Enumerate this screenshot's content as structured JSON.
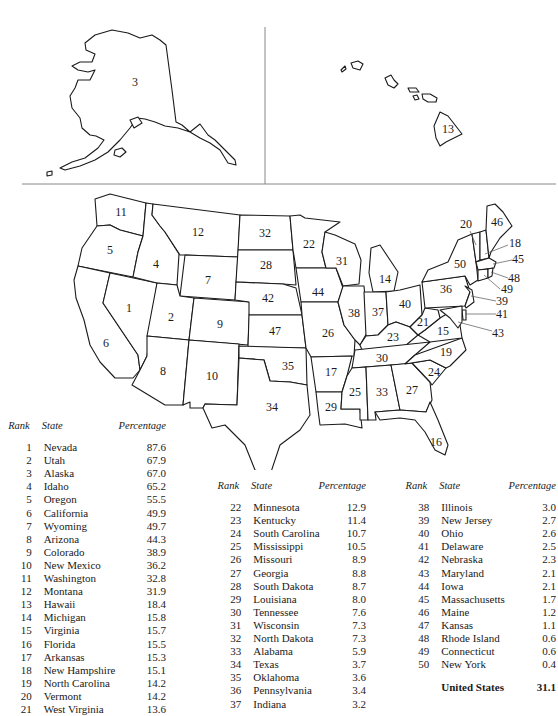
{
  "map": {
    "insets": [
      {
        "name": "Alaska",
        "rank": "3"
      },
      {
        "name": "Hawaii",
        "rank": "13"
      }
    ],
    "labels": [
      {
        "rank": "1",
        "state": "Nevada",
        "x": 129,
        "y": 309
      },
      {
        "rank": "2",
        "state": "Utah",
        "x": 171,
        "y": 318
      },
      {
        "rank": "3",
        "state": "Alaska",
        "x": 135,
        "y": 83
      },
      {
        "rank": "4",
        "state": "Idaho",
        "x": 156,
        "y": 265
      },
      {
        "rank": "5",
        "state": "Oregon",
        "x": 110,
        "y": 251
      },
      {
        "rank": "6",
        "state": "California",
        "x": 106,
        "y": 344
      },
      {
        "rank": "7",
        "state": "Wyoming",
        "x": 208,
        "y": 281
      },
      {
        "rank": "8",
        "state": "Arizona",
        "x": 163,
        "y": 372
      },
      {
        "rank": "9",
        "state": "Colorado",
        "x": 220,
        "y": 325
      },
      {
        "rank": "10",
        "state": "New Mexico",
        "x": 212,
        "y": 377
      },
      {
        "rank": "11",
        "state": "Washington",
        "x": 121,
        "y": 213
      },
      {
        "rank": "12",
        "state": "Montana",
        "x": 198,
        "y": 233
      },
      {
        "rank": "13",
        "state": "Hawaii",
        "x": 448,
        "y": 130
      },
      {
        "rank": "14",
        "state": "Michigan",
        "x": 385,
        "y": 280
      },
      {
        "rank": "15",
        "state": "Virginia",
        "x": 443,
        "y": 332
      },
      {
        "rank": "16",
        "state": "Florida",
        "x": 436,
        "y": 443
      },
      {
        "rank": "17",
        "state": "Arkansas",
        "x": 331,
        "y": 373
      },
      {
        "rank": "18",
        "state": "New Hampshire",
        "x": 515,
        "y": 244
      },
      {
        "rank": "19",
        "state": "North Carolina",
        "x": 446,
        "y": 353
      },
      {
        "rank": "20",
        "state": "Vermont",
        "x": 466,
        "y": 225
      },
      {
        "rank": "21",
        "state": "West Virginia",
        "x": 423,
        "y": 323
      },
      {
        "rank": "22",
        "state": "Minnesota",
        "x": 309,
        "y": 245
      },
      {
        "rank": "23",
        "state": "Kentucky",
        "x": 393,
        "y": 338
      },
      {
        "rank": "24",
        "state": "South Carolina",
        "x": 434,
        "y": 373
      },
      {
        "rank": "25",
        "state": "Mississippi",
        "x": 355,
        "y": 393
      },
      {
        "rank": "26",
        "state": "Missouri",
        "x": 328,
        "y": 334
      },
      {
        "rank": "27",
        "state": "Georgia",
        "x": 412,
        "y": 391
      },
      {
        "rank": "28",
        "state": "South Dakota",
        "x": 266,
        "y": 266
      },
      {
        "rank": "29",
        "state": "Louisiana",
        "x": 331,
        "y": 408
      },
      {
        "rank": "30",
        "state": "Tennessee",
        "x": 382,
        "y": 359
      },
      {
        "rank": "31",
        "state": "Wisconsin",
        "x": 342,
        "y": 262
      },
      {
        "rank": "32",
        "state": "North Dakota",
        "x": 265,
        "y": 234
      },
      {
        "rank": "33",
        "state": "Alabama",
        "x": 382,
        "y": 393
      },
      {
        "rank": "34",
        "state": "Texas",
        "x": 272,
        "y": 408
      },
      {
        "rank": "35",
        "state": "Oklahoma",
        "x": 288,
        "y": 367
      },
      {
        "rank": "36",
        "state": "Pennsylvania",
        "x": 446,
        "y": 290
      },
      {
        "rank": "37",
        "state": "Indiana",
        "x": 378,
        "y": 313
      },
      {
        "rank": "38",
        "state": "Illinois",
        "x": 354,
        "y": 314
      },
      {
        "rank": "39",
        "state": "New Jersey",
        "x": 502,
        "y": 302
      },
      {
        "rank": "40",
        "state": "Ohio",
        "x": 405,
        "y": 305
      },
      {
        "rank": "41",
        "state": "Delaware",
        "x": 502,
        "y": 315
      },
      {
        "rank": "42",
        "state": "Nebraska",
        "x": 268,
        "y": 299
      },
      {
        "rank": "43",
        "state": "Maryland",
        "x": 498,
        "y": 334
      },
      {
        "rank": "44",
        "state": "Iowa",
        "x": 318,
        "y": 293
      },
      {
        "rank": "45",
        "state": "Massachusetts",
        "x": 518,
        "y": 260
      },
      {
        "rank": "46",
        "state": "Maine",
        "x": 497,
        "y": 223
      },
      {
        "rank": "47",
        "state": "Kansas",
        "x": 275,
        "y": 332
      },
      {
        "rank": "48",
        "state": "Rhode Island",
        "x": 514,
        "y": 279
      },
      {
        "rank": "49",
        "state": "Connecticut",
        "x": 507,
        "y": 290
      },
      {
        "rank": "50",
        "state": "New York",
        "x": 460,
        "y": 265
      }
    ]
  },
  "tables": {
    "headers": {
      "rank": "Rank",
      "state": "State",
      "percentage": "Percentage"
    },
    "columns": [
      {
        "rows": [
          {
            "rank": "1",
            "state": "Nevada",
            "percentage": "87.6"
          },
          {
            "rank": "2",
            "state": "Utah",
            "percentage": "67.9"
          },
          {
            "rank": "3",
            "state": "Alaska",
            "percentage": "67.0"
          },
          {
            "rank": "4",
            "state": "Idaho",
            "percentage": "65.2"
          },
          {
            "rank": "5",
            "state": "Oregon",
            "percentage": "55.5"
          },
          {
            "rank": "6",
            "state": "California",
            "percentage": "49.9"
          },
          {
            "rank": "7",
            "state": "Wyoming",
            "percentage": "49.7"
          },
          {
            "rank": "8",
            "state": "Arizona",
            "percentage": "44.3"
          },
          {
            "rank": "9",
            "state": "Colorado",
            "percentage": "38.9"
          },
          {
            "rank": "10",
            "state": "New Mexico",
            "percentage": "36.2"
          },
          {
            "rank": "11",
            "state": "Washington",
            "percentage": "32.8"
          },
          {
            "rank": "12",
            "state": "Montana",
            "percentage": "31.9"
          },
          {
            "rank": "13",
            "state": "Hawaii",
            "percentage": "18.4"
          },
          {
            "rank": "14",
            "state": "Michigan",
            "percentage": "15.8"
          },
          {
            "rank": "15",
            "state": "Virginia",
            "percentage": "15.7"
          },
          {
            "rank": "16",
            "state": "Florida",
            "percentage": "15.5"
          },
          {
            "rank": "17",
            "state": "Arkansas",
            "percentage": "15.3"
          },
          {
            "rank": "18",
            "state": "New Hampshire",
            "percentage": "15.1"
          },
          {
            "rank": "19",
            "state": "North Carolina",
            "percentage": "14.2"
          },
          {
            "rank": "20",
            "state": "Vermont",
            "percentage": "14.2"
          },
          {
            "rank": "21",
            "state": "West Virginia",
            "percentage": "13.6"
          }
        ]
      },
      {
        "rows": [
          {
            "rank": "22",
            "state": "Minnesota",
            "percentage": "12.9"
          },
          {
            "rank": "23",
            "state": "Kentucky",
            "percentage": "11.4"
          },
          {
            "rank": "24",
            "state": "South Carolina",
            "percentage": "10.7"
          },
          {
            "rank": "25",
            "state": "Mississippi",
            "percentage": "10.5"
          },
          {
            "rank": "26",
            "state": "Missouri",
            "percentage": "8.9"
          },
          {
            "rank": "27",
            "state": "Georgia",
            "percentage": "8.8"
          },
          {
            "rank": "28",
            "state": "South Dakota",
            "percentage": "8.7"
          },
          {
            "rank": "29",
            "state": "Louisiana",
            "percentage": "8.0"
          },
          {
            "rank": "30",
            "state": "Tennessee",
            "percentage": "7.6"
          },
          {
            "rank": "31",
            "state": "Wisconsin",
            "percentage": "7.3"
          },
          {
            "rank": "32",
            "state": "North Dakota",
            "percentage": "7.3"
          },
          {
            "rank": "33",
            "state": "Alabama",
            "percentage": "5.9"
          },
          {
            "rank": "34",
            "state": "Texas",
            "percentage": "3.7"
          },
          {
            "rank": "35",
            "state": "Oklahoma",
            "percentage": "3.6"
          },
          {
            "rank": "36",
            "state": "Pennsylvania",
            "percentage": "3.4"
          },
          {
            "rank": "37",
            "state": "Indiana",
            "percentage": "3.2"
          }
        ]
      },
      {
        "rows": [
          {
            "rank": "38",
            "state": "Illinois",
            "percentage": "3.0"
          },
          {
            "rank": "39",
            "state": "New Jersey",
            "percentage": "2.7"
          },
          {
            "rank": "40",
            "state": "Ohio",
            "percentage": "2.6"
          },
          {
            "rank": "41",
            "state": "Delaware",
            "percentage": "2.5"
          },
          {
            "rank": "42",
            "state": "Nebraska",
            "percentage": "2.3"
          },
          {
            "rank": "43",
            "state": "Maryland",
            "percentage": "2.1"
          },
          {
            "rank": "44",
            "state": "Iowa",
            "percentage": "2.1"
          },
          {
            "rank": "45",
            "state": "Massachusetts",
            "percentage": "1.7"
          },
          {
            "rank": "46",
            "state": "Maine",
            "percentage": "1.2"
          },
          {
            "rank": "47",
            "state": "Kansas",
            "percentage": "1.1"
          },
          {
            "rank": "48",
            "state": "Rhode Island",
            "percentage": "0.6"
          },
          {
            "rank": "49",
            "state": "Connecticut",
            "percentage": "0.6"
          },
          {
            "rank": "50",
            "state": "New York",
            "percentage": "0.4"
          }
        ],
        "total": {
          "state": "United States",
          "percentage": "31.1"
        }
      }
    ]
  }
}
